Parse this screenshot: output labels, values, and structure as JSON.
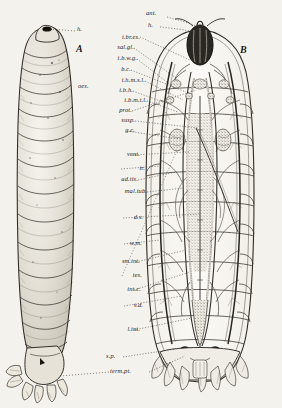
{
  "plate": {
    "background_color": "#f4f2ec",
    "ink_color": "#20201c",
    "figures": [
      {
        "key": "A",
        "label": "A",
        "caption": "whole larva, external lateral view"
      },
      {
        "key": "B",
        "label": "B",
        "caption": "dissected larva, dorsal view of internal anatomy"
      }
    ]
  },
  "top_labels": [
    {
      "id": "ant",
      "text": "ant."
    },
    {
      "id": "h-top",
      "text": "h."
    }
  ],
  "figure_a": {
    "label": "A",
    "head_label": {
      "id": "h",
      "text": "h."
    },
    "segment_count": 12
  },
  "figure_b": {
    "label": "B"
  },
  "labels_left_column": [
    {
      "id": "oes",
      "text": "oes."
    }
  ],
  "labels_main_column": [
    {
      "id": "i-br-es",
      "text": "i.br.es."
    },
    {
      "id": "sal-gl",
      "text": "sal.gl."
    },
    {
      "id": "i-b-w-g",
      "text": "i.b.w.g."
    },
    {
      "id": "b-c",
      "text": "b.c."
    },
    {
      "id": "i-h-m-s-l",
      "text": "i.h.m.s.l."
    },
    {
      "id": "i-b-h",
      "text": "i.b.h."
    },
    {
      "id": "i-b-m-t-l",
      "text": "i.b.m.t.l."
    },
    {
      "id": "prot",
      "text": "prot."
    },
    {
      "id": "susp",
      "text": "susp."
    },
    {
      "id": "g-c",
      "text": "g.c."
    },
    {
      "id": "vent",
      "text": "vent."
    },
    {
      "id": "tr",
      "text": "tr."
    },
    {
      "id": "ad-tis",
      "text": "ad.tis."
    },
    {
      "id": "mal-tub",
      "text": "mal.tub."
    },
    {
      "id": "d-v",
      "text": "d.v."
    },
    {
      "id": "w-m",
      "text": "w.m."
    },
    {
      "id": "sm-int",
      "text": "sm.int."
    },
    {
      "id": "tes",
      "text": "tes."
    },
    {
      "id": "int-c",
      "text": "int.c."
    },
    {
      "id": "v-d",
      "text": "v.d."
    },
    {
      "id": "l-int",
      "text": "l.int."
    }
  ],
  "labels_bottom": [
    {
      "id": "s-p",
      "text": "s.p."
    },
    {
      "id": "term-pt",
      "text": "term.pt."
    }
  ]
}
